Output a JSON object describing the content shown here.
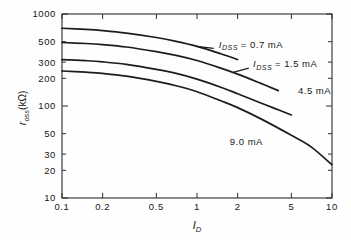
{
  "figure": {
    "background_color": "#fefefe",
    "ink_color": "#1c1c1c"
  },
  "chart_data": {
    "type": "line",
    "title": "",
    "subtitle": "",
    "xlabel": "I_D",
    "xlabel_main": "I",
    "xlabel_sub": "D",
    "ylabel": "r_oss (kΩ)",
    "ylabel_main": "r",
    "ylabel_sub": "oss",
    "ylabel_unit": "(kΩ)",
    "xscale": "log",
    "yscale": "log",
    "xlim": [
      0.1,
      10
    ],
    "ylim": [
      10,
      1000
    ],
    "grid": false,
    "legend_position": "inline-annotations",
    "xticks": [
      0.1,
      0.2,
      0.5,
      1,
      2,
      5,
      10
    ],
    "xticklabels": [
      "0.1",
      "0.2",
      "0.5",
      "1",
      "2",
      "5",
      "10"
    ],
    "yticks": [
      10,
      20,
      30,
      50,
      100,
      200,
      300,
      500,
      1000
    ],
    "yticklabels": [
      "10",
      "20",
      "30",
      "50",
      "100",
      "200",
      "300",
      "500",
      "1000"
    ],
    "series": [
      {
        "name": "I_DSS = 0.7 mA",
        "label_text": "= 0.7 mA",
        "label_symbol": "I",
        "label_symbol_sub": "DSS",
        "label_x": 1.45,
        "label_y": 430,
        "x": [
          0.1,
          0.15,
          0.2,
          0.3,
          0.5,
          0.7,
          1.0,
          1.5,
          2.0
        ],
        "y": [
          700,
          680,
          660,
          620,
          555,
          505,
          445,
          370,
          320
        ]
      },
      {
        "name": "I_DSS = 1.5 mA",
        "label_text": "= 1.5 mA",
        "label_symbol": "I",
        "label_symbol_sub": "DSS",
        "label_x": 2.6,
        "label_y": 265,
        "x": [
          0.1,
          0.15,
          0.2,
          0.3,
          0.5,
          0.7,
          1.0,
          1.5,
          2.0,
          3.0,
          4.0
        ],
        "y": [
          490,
          478,
          465,
          438,
          390,
          355,
          312,
          258,
          222,
          175,
          147
        ]
      },
      {
        "name": "4.5 mA",
        "label_text": "4.5 mA",
        "label_symbol": "",
        "label_symbol_sub": "",
        "label_x": 5.6,
        "label_y": 135,
        "x": [
          0.1,
          0.15,
          0.2,
          0.3,
          0.5,
          0.7,
          1.0,
          1.5,
          2.0,
          3.0,
          4.0,
          5.0
        ],
        "y": [
          320,
          311,
          302,
          283,
          250,
          226,
          196,
          160,
          136,
          107,
          91,
          80
        ]
      },
      {
        "name": "9.0 mA",
        "label_text": "9.0 mA",
        "label_symbol": "",
        "label_symbol_sub": "",
        "label_x": 1.75,
        "label_y": 38,
        "x": [
          0.1,
          0.15,
          0.2,
          0.3,
          0.5,
          0.7,
          1.0,
          1.5,
          2.0,
          3.0,
          5.0,
          7.0,
          10.0
        ],
        "y": [
          240,
          233,
          226,
          211,
          185,
          166,
          143,
          114,
          96,
          72,
          48,
          36,
          23
        ]
      }
    ],
    "annotations": [
      {
        "name": "leader-0.7ma",
        "from_x": 1.0,
        "from_y": 445,
        "to_x": 1.33,
        "to_y": 423
      },
      {
        "name": "leader-1.5ma",
        "from_x": 1.85,
        "from_y": 232,
        "to_x": 2.42,
        "to_y": 258
      }
    ]
  }
}
